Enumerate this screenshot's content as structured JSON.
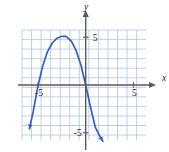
{
  "figure": {
    "type": "cartesian-graph",
    "width": 169,
    "height": 152,
    "background": "#ffffff"
  },
  "axes": {
    "x_axis_label": "x",
    "y_axis_label": "y",
    "x_tick_labels": [
      {
        "text": "-5",
        "value": -5
      },
      {
        "text": "5",
        "value": 5
      }
    ],
    "y_tick_labels": [
      {
        "text": "5",
        "value": 5
      },
      {
        "text": "-5",
        "value": -5
      }
    ],
    "axis_color": "#5a5a5a",
    "grid_color": "#aec4e0",
    "grid_visible": true
  },
  "chart_data": {
    "type": "line",
    "title": "",
    "xlabel": "x",
    "ylabel": "y",
    "xlim": [
      -6.5,
      6.5
    ],
    "ylim": [
      -5.8,
      5.8
    ],
    "grid": true,
    "legend": null,
    "xticks": [
      -5,
      5
    ],
    "yticks": [
      -5,
      5
    ],
    "grid_step": 1,
    "series": [
      {
        "name": "parabola",
        "color": "#3c5fb5",
        "curve": "downward-opening parabola",
        "vertex": [
          -2.1,
          5.1
        ],
        "x_intercepts": [
          -5.0,
          0.0
        ],
        "arrow_ends": true,
        "x": [
          -5.9,
          -5.5,
          -5.0,
          -4.5,
          -4.0,
          -3.5,
          -3.0,
          -2.5,
          -2.1,
          -2.0,
          -1.5,
          -1.0,
          -0.5,
          0.0,
          0.5,
          1.0,
          1.5,
          1.8
        ],
        "y": [
          -4.6,
          -2.8,
          -0.1,
          2.0,
          3.5,
          4.4,
          4.9,
          5.1,
          5.1,
          5.05,
          4.6,
          3.6,
          2.1,
          0.0,
          -2.3,
          -4.4,
          -5.4,
          -5.9
        ]
      }
    ]
  }
}
